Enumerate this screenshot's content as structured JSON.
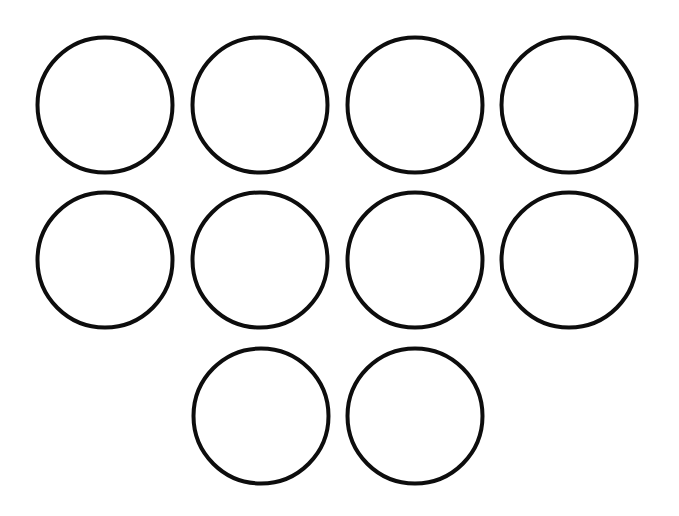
{
  "diagram": {
    "background": "#ffffff",
    "stroke_color": "#0d0d0d",
    "stroke_width": 4,
    "radius": 67.5,
    "rows": [
      {
        "count": 4,
        "cy": 105
      },
      {
        "count": 4,
        "cy": 260
      },
      {
        "count": 2,
        "cy": 416
      }
    ],
    "circles": [
      {
        "cx": 105,
        "cy": 105
      },
      {
        "cx": 260,
        "cy": 105
      },
      {
        "cx": 415,
        "cy": 105
      },
      {
        "cx": 569,
        "cy": 105
      },
      {
        "cx": 105,
        "cy": 260
      },
      {
        "cx": 260,
        "cy": 260
      },
      {
        "cx": 415,
        "cy": 260
      },
      {
        "cx": 569,
        "cy": 260
      },
      {
        "cx": 261,
        "cy": 416
      },
      {
        "cx": 415,
        "cy": 416
      }
    ]
  }
}
